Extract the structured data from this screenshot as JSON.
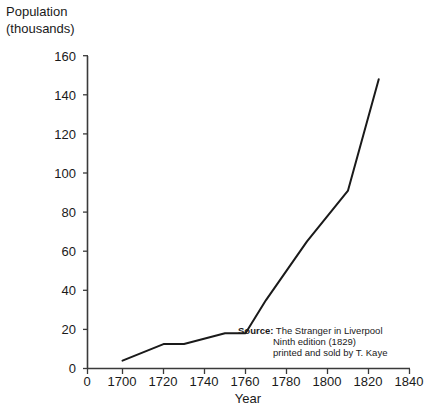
{
  "axis_titles": {
    "y_line1": "Population",
    "y_line2": "(thousands)",
    "x": "Year"
  },
  "y_ticks": [
    "0",
    "20",
    "40",
    "60",
    "80",
    "100",
    "120",
    "140",
    "160"
  ],
  "x_ticks": [
    "0",
    "1700",
    "1720",
    "1740",
    "1760",
    "1780",
    "1800",
    "1820",
    "1840"
  ],
  "source_note": {
    "label": "Source:",
    "line1": "The Stranger in Liverpool",
    "line2": "Ninth edition (1829)",
    "line3": "printed and sold by T. Kaye"
  },
  "colors": {
    "line": "#1a1a1a",
    "axis": "#3a3a3a",
    "background": "#ffffff",
    "text": "#1a1a1a"
  },
  "chart_data": {
    "type": "line",
    "title": "",
    "subtitle": "",
    "xlabel": "Year",
    "ylabel": "Population (thousands)",
    "xlim": [
      1690,
      1840
    ],
    "ylim": [
      0,
      160
    ],
    "x_tick_values": [
      1700,
      1720,
      1740,
      1760,
      1780,
      1800,
      1820,
      1840
    ],
    "y_tick_values": [
      0,
      20,
      40,
      60,
      80,
      100,
      120,
      140,
      160
    ],
    "grid": false,
    "legend": false,
    "axis_break_note": "x axis shows a 0 tick at the origin before the 1700 tick (scale break)",
    "series": [
      {
        "name": "Liverpool population",
        "x": [
          1700,
          1720,
          1730,
          1750,
          1760,
          1770,
          1790,
          1810,
          1825
        ],
        "y": [
          4,
          12.5,
          12.5,
          18,
          18,
          35,
          65,
          91,
          148
        ]
      }
    ],
    "annotations": [
      {
        "text": "Source: The Stranger in Liverpool / Ninth edition (1829) / printed and sold by T. Kaye",
        "x": 1775,
        "y": 25
      }
    ]
  }
}
